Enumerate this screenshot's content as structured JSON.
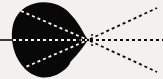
{
  "figure": {
    "type": "schematic-diagram",
    "width": 163,
    "height": 79,
    "background_color": "#f2f1ee",
    "blob_color": "#080808",
    "ray_light_color": "#f7f6f3",
    "ray_dark_color": "#0b0b0b"
  },
  "focus_point": {
    "label": "focal-point",
    "x": 88,
    "y": 40
  },
  "blob": {
    "label": "dark-lobe",
    "fill": "#080808",
    "center_x": 48,
    "center_y": 38,
    "radius_x": 36,
    "radius_y": 40,
    "tip_x": 88,
    "tip_y": 40,
    "left_edge_x": 13,
    "top_edge_y": 0,
    "bottom_edge_y": 74
  },
  "axis_line": {
    "label": "optical-axis-stub",
    "color": "#0b0b0b",
    "x1": 0,
    "y1": 40,
    "x2": 15,
    "y2": 40,
    "width": 1.6
  },
  "interior_rays": {
    "color": "#f7f6f3",
    "dash": "3 3",
    "width": 1.8,
    "items": [
      {
        "name": "interior-ray-upper",
        "x1": 21,
        "y1": 11,
        "x2": 88,
        "y2": 40
      },
      {
        "name": "interior-ray-axis",
        "x1": 13,
        "y1": 40,
        "x2": 88,
        "y2": 40
      },
      {
        "name": "interior-ray-lower",
        "x1": 21,
        "y1": 69,
        "x2": 88,
        "y2": 40
      }
    ]
  },
  "exterior_rays": {
    "color": "#0b0b0b",
    "dash": "3 3",
    "width": 1.8,
    "items": [
      {
        "name": "exterior-ray-upper",
        "x1": 90,
        "y1": 39,
        "x2": 157,
        "y2": 8
      },
      {
        "name": "exterior-ray-axis",
        "x1": 90,
        "y1": 40,
        "x2": 163,
        "y2": 40
      },
      {
        "name": "exterior-ray-lower",
        "x1": 90,
        "y1": 41,
        "x2": 157,
        "y2": 72
      }
    ]
  },
  "focus_cluster": {
    "name": "focal-dot-cluster",
    "color": "#0b0b0b",
    "dots": [
      {
        "x": 84,
        "y": 36,
        "r": 1.0
      },
      {
        "x": 84,
        "y": 44,
        "r": 1.0
      },
      {
        "x": 88,
        "y": 40,
        "r": 1.3
      },
      {
        "x": 92,
        "y": 35,
        "r": 1.0
      },
      {
        "x": 92,
        "y": 45,
        "r": 1.0
      },
      {
        "x": 80,
        "y": 40,
        "r": 1.0
      }
    ]
  }
}
